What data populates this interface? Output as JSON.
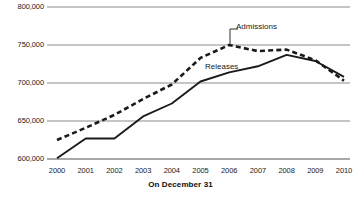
{
  "chart_data": {
    "type": "line",
    "title": "",
    "xlabel": "On December 31",
    "ylabel": "",
    "x": [
      2000,
      2001,
      2002,
      2003,
      2004,
      2005,
      2006,
      2007,
      2008,
      2009,
      2010
    ],
    "xticklabels": [
      "2000",
      "2001",
      "2002",
      "2003",
      "2004",
      "2005",
      "2006",
      "2007",
      "2008",
      "2009",
      "2010"
    ],
    "yticklabels": [
      "800,000",
      "750,000",
      "700,000",
      "650,000",
      "600,000"
    ],
    "ylim": [
      600000,
      800000
    ],
    "ytick_values": [
      800000,
      750000,
      700000,
      650000,
      600000
    ],
    "grid": true,
    "legend": "inline-annotations",
    "series": [
      {
        "name": "Admissions",
        "style": "dashed",
        "color": "#1a1a1a",
        "values": [
          625000,
          641000,
          658000,
          679000,
          698000,
          733000,
          750000,
          742000,
          744000,
          730000,
          703000
        ]
      },
      {
        "name": "Releases",
        "style": "solid",
        "color": "#1a1a1a",
        "values": [
          601000,
          627000,
          627000,
          656000,
          673000,
          702000,
          714000,
          722000,
          737000,
          729000,
          708000
        ]
      }
    ]
  },
  "annotations": {
    "admissions_label": "Admissions",
    "releases_label": "Releases"
  },
  "colors": {
    "gridline": "#8c8c8c",
    "axis": "#4d4d4d",
    "series": "#1a1a1a",
    "background": "#ffffff"
  }
}
